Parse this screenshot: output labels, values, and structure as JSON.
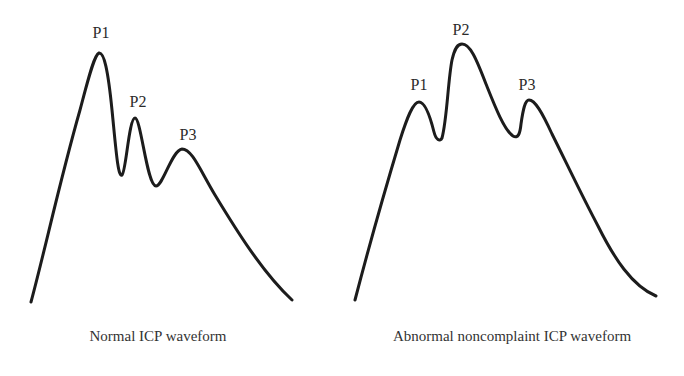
{
  "panels": [
    {
      "id": "normal",
      "caption": "Normal ICP waveform",
      "peaks": [
        {
          "label": "P1",
          "x": 101,
          "y": 38
        },
        {
          "label": "P2",
          "x": 138,
          "y": 107
        },
        {
          "label": "P3",
          "x": 188,
          "y": 140
        }
      ]
    },
    {
      "id": "abnormal",
      "caption": "Abnormal noncomplaint ICP waveform",
      "peaks": [
        {
          "label": "P1",
          "x": 419,
          "y": 90
        },
        {
          "label": "P2",
          "x": 461,
          "y": 35
        },
        {
          "label": "P3",
          "x": 527,
          "y": 90
        }
      ]
    }
  ],
  "colors": {
    "stroke": "#1c1c1c",
    "text": "#2a2a2a",
    "background": "#ffffff"
  }
}
